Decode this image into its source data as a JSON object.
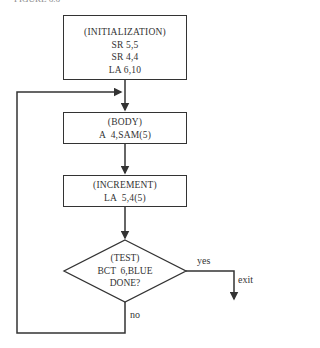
{
  "caption": "FIGURE 6.6",
  "colors": {
    "stroke": "#333333",
    "background": "#ffffff"
  },
  "nodes": {
    "initialization": {
      "title": "(INITIALIZATION)",
      "lines": [
        "SR 5,5",
        "SR 4,4",
        "LA 6,10"
      ]
    },
    "body": {
      "title": "(BODY)",
      "lines": [
        "A  4,SAM(5)"
      ]
    },
    "increment": {
      "title": "(INCREMENT)",
      "lines": [
        "LA  5,4(5)"
      ]
    },
    "test": {
      "title": "(TEST)",
      "lines": [
        "BCT  6,BLUE",
        "DONE?"
      ]
    }
  },
  "edges": {
    "yes_label": "yes",
    "exit_label": "exit",
    "no_label": "no"
  }
}
